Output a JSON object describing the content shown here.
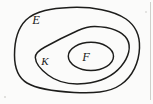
{
  "figure": {
    "kind": "nested-set-venn-diagram",
    "background_color": "#fbfbfa",
    "stroke_color": "#1d1d1b",
    "width": 153,
    "height": 104,
    "labels": [
      {
        "id": "e",
        "text": "E",
        "x": 36,
        "y": 24,
        "set": "outer"
      },
      {
        "id": "k",
        "text": "K",
        "x": 45,
        "y": 65,
        "set": "middle"
      },
      {
        "id": "f",
        "text": "F",
        "x": 86,
        "y": 61,
        "set": "inner"
      }
    ],
    "curves": [
      {
        "id": "outer",
        "label": "E",
        "shape": "irregular-blob",
        "bounds": {
          "x": 14,
          "y": 7,
          "width": 126,
          "height": 86
        }
      },
      {
        "id": "middle",
        "label": "K",
        "shape": "teardrop-pear",
        "bounds": {
          "x": 35,
          "y": 26,
          "width": 94,
          "height": 58
        }
      },
      {
        "id": "inner",
        "label": "F",
        "shape": "ellipse",
        "bounds": {
          "x": 68,
          "y": 42,
          "width": 46,
          "height": 29
        }
      }
    ]
  }
}
